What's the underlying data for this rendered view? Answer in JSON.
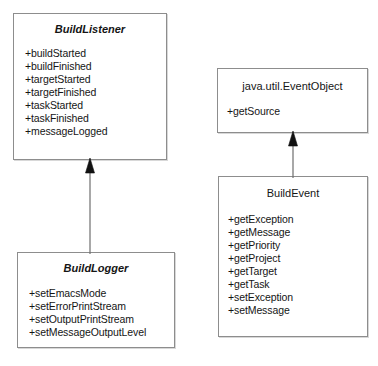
{
  "diagram": {
    "kind": "uml-class-diagram",
    "background_color": "#ffffff",
    "line_color": "#8d8d8d",
    "text_color": "#151515"
  },
  "classes": [
    {
      "id": "buildlistener",
      "name": "BuildListener",
      "style": "italic",
      "members": [
        "+buildStarted",
        "+buildFinished",
        "+targetStarted",
        "+targetFinished",
        "+taskStarted",
        "+taskFinished",
        "+messageLogged"
      ]
    },
    {
      "id": "eventobject",
      "name": "java.util.EventObject",
      "style": "plain",
      "members": [
        "+getSource"
      ]
    },
    {
      "id": "buildevent",
      "name": "BuildEvent",
      "style": "plain",
      "members": [
        "+getException",
        "+getMessage",
        "+getPriority",
        "+getProject",
        "+getTarget",
        "+getTask",
        "+setException",
        "+setMessage"
      ]
    },
    {
      "id": "buildlogger",
      "name": "BuildLogger",
      "style": "italic",
      "members": [
        "+setEmacsMode",
        "+setErrorPrintStream",
        "+setOutputPrintStream",
        "+setMessageOutputLevel"
      ]
    }
  ],
  "relationships": [
    {
      "id": "logger-to-listener",
      "type": "generalization",
      "from": "BuildLogger",
      "to": "BuildListener"
    },
    {
      "id": "event-to-eventobject",
      "type": "generalization",
      "from": "BuildEvent",
      "to": "java.util.EventObject"
    }
  ]
}
